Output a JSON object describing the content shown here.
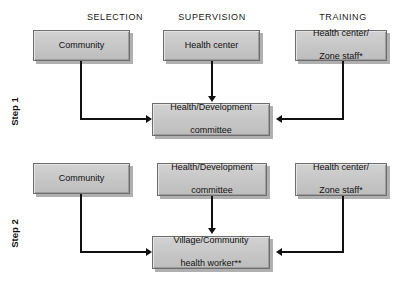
{
  "diagram": {
    "type": "flowchart",
    "columns": [
      {
        "id": "selection",
        "label": "SELECTION",
        "center_x": 115
      },
      {
        "id": "supervision",
        "label": "SUPERVISION",
        "center_x": 212
      },
      {
        "id": "training",
        "label": "TRAINING",
        "center_x": 343
      }
    ],
    "steps": [
      {
        "id": "step-1",
        "label": "Step 1",
        "sources": [
          {
            "id": "s1-selection",
            "column": "selection",
            "text": "Community"
          },
          {
            "id": "s1-supervision",
            "column": "supervision",
            "text": "Health center"
          },
          {
            "id": "s1-training",
            "column": "training",
            "text": "Health center/\nZone staff*"
          }
        ],
        "target": {
          "id": "s1-target",
          "text": "Health/Development\ncommittee"
        },
        "edges": [
          {
            "from": "s1-selection",
            "to": "s1-target",
            "route": "down-right",
            "arrow": "right"
          },
          {
            "from": "s1-supervision",
            "to": "s1-target",
            "route": "down",
            "arrow": "down"
          },
          {
            "from": "s1-training",
            "to": "s1-target",
            "route": "down-left",
            "arrow": "left"
          }
        ]
      },
      {
        "id": "step-2",
        "label": "Step 2",
        "sources": [
          {
            "id": "s2-selection",
            "column": "selection",
            "text": "Community"
          },
          {
            "id": "s2-supervision",
            "column": "supervision",
            "text": "Health/Development\ncommittee"
          },
          {
            "id": "s2-training",
            "column": "training",
            "text": "Health center/\nZone staff*"
          }
        ],
        "target": {
          "id": "s2-target",
          "text": "Village/Community\nhealth worker**"
        },
        "edges": [
          {
            "from": "s2-selection",
            "to": "s2-target",
            "route": "down-right",
            "arrow": "right"
          },
          {
            "from": "s2-supervision",
            "to": "s2-target",
            "route": "down",
            "arrow": "down"
          },
          {
            "from": "s2-training",
            "to": "s2-target",
            "route": "down-left",
            "arrow": "left"
          }
        ]
      }
    ],
    "node_labels": {
      "s1_community": "Community",
      "s1_health_center": "Health center",
      "s1_health_center_zone_staff_l1": "Health center/",
      "s1_health_center_zone_staff_l2": "Zone staff*",
      "s1_committee_l1": "Health/Development",
      "s1_committee_l2": "committee",
      "s2_community": "Community",
      "s2_committee_l1": "Health/Development",
      "s2_committee_l2": "committee",
      "s2_health_center_zone_staff_l1": "Health center/",
      "s2_health_center_zone_staff_l2": "Zone staff*",
      "s2_worker_l1": "Village/Community",
      "s2_worker_l2": "health worker**"
    },
    "colors": {
      "box_fill": "#c6c6c6",
      "box_border": "#6d6d6d",
      "box_shadow": "#969696",
      "line": "#111111",
      "text": "#111111",
      "background": "#ffffff"
    }
  }
}
